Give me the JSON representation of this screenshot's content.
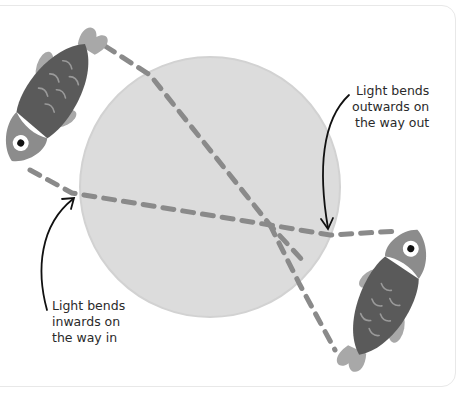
{
  "diagram": {
    "labels": {
      "out": "Light bends\noutwards on\nthe way out",
      "in": "Light bends\ninwards on\nthe way in"
    },
    "colors": {
      "background": "#ffffff",
      "frame": "#e8e8e8",
      "circle": "#dcdcdc",
      "circle_edge": "#d4d4d4",
      "dashes": "#8a8a8a",
      "fish_body_dark": "#5a5a5a",
      "fish_head": "#8c8c8c",
      "fish_fins": "#a8a8a8",
      "fish_scales": "#9a9a9a",
      "arrows": "#111111"
    },
    "elements": [
      "fish-top-left",
      "fish-bottom-right",
      "water-droplet-circle",
      "light-ray-paths",
      "annotation-arrows"
    ]
  }
}
